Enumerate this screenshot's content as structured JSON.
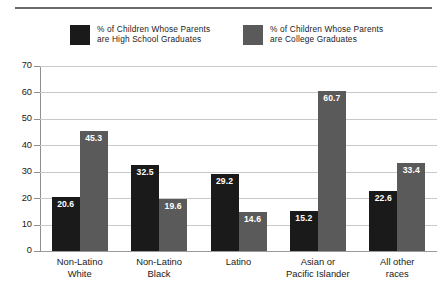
{
  "chart_data": {
    "type": "bar",
    "title": "",
    "subtitle": "",
    "xlabel": "",
    "ylabel": "",
    "ylim": [
      0,
      70
    ],
    "yticks": [
      0,
      10,
      20,
      30,
      40,
      50,
      60,
      70
    ],
    "ytick_labels": [
      "0",
      "10",
      "20",
      "30",
      "40",
      "50",
      "60",
      "70"
    ],
    "grid": true,
    "legend_position": "top",
    "categories": [
      "Non-Latino\nWhite",
      "Non-Latino\nBlack",
      "Latino",
      "Asian or\nPacific Islander",
      "All other\nraces"
    ],
    "series": [
      {
        "name": "% of Children Whose Parents\nare High School Graduates",
        "color": "#1a1a1a",
        "values": [
          20.6,
          32.5,
          29.2,
          15.2,
          22.6
        ],
        "value_labels": [
          "20.6",
          "32.5",
          "29.2",
          "15.2",
          "22.6"
        ]
      },
      {
        "name": "% of Children Whose Parents\nare College Graduates",
        "color": "#5a5a5a",
        "values": [
          45.3,
          19.6,
          14.6,
          60.7,
          33.4
        ],
        "value_labels": [
          "45.3",
          "19.6",
          "14.6",
          "60.7",
          "33.4"
        ]
      }
    ]
  },
  "legend": {
    "entries": [
      {
        "label": "% of Children Whose Parents\nare High School Graduates",
        "color": "#1a1a1a"
      },
      {
        "label": "% of Children Whose Parents\nare College Graduates",
        "color": "#5a5a5a"
      }
    ]
  },
  "colors": {
    "series_high_school": "#1a1a1a",
    "series_college": "#5a5a5a",
    "gridline": "#c9c9c9",
    "axis": "#8f8f8f",
    "rule": "#6b6b6b",
    "background": "#ffffff",
    "text": "#1a1a1a",
    "value_label_text": "#ffffff"
  }
}
